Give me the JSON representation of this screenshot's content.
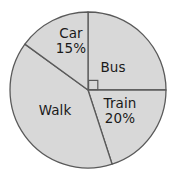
{
  "chart_data": {
    "type": "pie",
    "title": "",
    "subtitle": "",
    "xlabel": "",
    "ylabel": "",
    "grid": false,
    "legend": "none",
    "labels_inside_slices": true,
    "fill_color": "#d8d8d8",
    "outline_color": "#5a5a5a",
    "background_color": "#ffffff",
    "text_color": "#1a1a1a",
    "center": [
      88,
      90
    ],
    "radius": 78,
    "start_angle_deg": 0,
    "direction": "clockwise",
    "right_angle_marker": {
      "present": true,
      "slice": "Bus",
      "note": "square symbol at centre between the upward and rightward radii"
    },
    "categories": [
      "Bus",
      "Train",
      "Walk",
      "Car"
    ],
    "values": [
      25,
      20,
      40,
      15
    ],
    "slices": [
      {
        "name": "Bus",
        "value": 25,
        "percent_label": "",
        "label_shown": "Bus",
        "angle_deg": 90,
        "start_deg": 0,
        "end_deg": 90,
        "label_x": 113,
        "label_y": 67
      },
      {
        "name": "Train",
        "value": 20,
        "percent_label": "20%",
        "label_shown": "Train 20%",
        "angle_deg": 72,
        "start_deg": 90,
        "end_deg": 162,
        "label_x": 120,
        "label_y": 110
      },
      {
        "name": "Walk",
        "value": 40,
        "percent_label": "",
        "label_shown": "Walk",
        "angle_deg": 144,
        "start_deg": 162,
        "end_deg": 306,
        "label_x": 55,
        "label_y": 110
      },
      {
        "name": "Car",
        "value": 15,
        "percent_label": "15%",
        "label_shown": "Car 15%",
        "angle_deg": 54,
        "start_deg": 306,
        "end_deg": 360,
        "label_x": 71,
        "label_y": 40
      }
    ]
  }
}
